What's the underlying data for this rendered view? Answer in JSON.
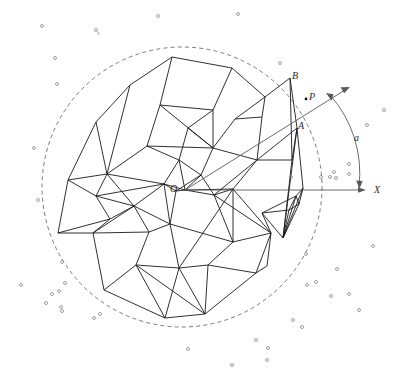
{
  "figure": {
    "background_color": "#ffffff",
    "mesh_color": "#1a1a1a",
    "circle_color": "#6b6b6b",
    "axis_color": "#5a5a5a",
    "dot_color": "#8a8a8a",
    "width": 399,
    "height": 372
  },
  "labels": [
    {
      "name": "origin-label",
      "text": "O",
      "x": 170,
      "y": 184
    },
    {
      "name": "point-b-label",
      "text": "B",
      "x": 292,
      "y": 71
    },
    {
      "name": "point-p-label",
      "text": "P",
      "x": 309,
      "y": 92
    },
    {
      "name": "point-a-label",
      "text": "A",
      "x": 298,
      "y": 121
    },
    {
      "name": "angle-label",
      "text": "a",
      "x": 354,
      "y": 133
    },
    {
      "name": "xaxis-label",
      "text": "X",
      "x": 374,
      "y": 185
    },
    {
      "name": "stray-label",
      "text": "s",
      "x": 97,
      "y": 30
    }
  ],
  "geometry": {
    "circle": {
      "cx": 182,
      "cy": 187,
      "r": 140,
      "dash": "4 3.2"
    },
    "origin": {
      "x": 185,
      "y": 190
    },
    "x_axis": {
      "x1": 185,
      "y1": 190,
      "x2": 366,
      "y2": 190
    },
    "ray": {
      "x1": 185,
      "y1": 190,
      "x2": 348,
      "y2": 88
    },
    "angle_arc": {
      "start_x": 330,
      "start_y": 95,
      "end_x": 359,
      "end_y": 187,
      "radius": 118
    },
    "point_A": {
      "x": 297,
      "y": 128
    },
    "point_B": {
      "x": 290,
      "y": 78
    },
    "point_P": {
      "x": 306,
      "y": 99
    }
  },
  "mesh_vertices": [
    [
      185,
      190
    ],
    [
      179,
      160
    ],
    [
      164,
      184
    ],
    [
      201,
      175
    ],
    [
      233,
      189
    ],
    [
      176,
      191
    ],
    [
      130,
      85
    ],
    [
      172,
      57
    ],
    [
      232,
      68
    ],
    [
      265,
      97
    ],
    [
      290,
      78
    ],
    [
      297,
      128
    ],
    [
      303,
      188
    ],
    [
      299,
      204
    ],
    [
      289,
      210
    ],
    [
      262,
      213
    ],
    [
      271,
      233
    ],
    [
      267,
      266
    ],
    [
      233,
      242
    ],
    [
      208,
      265
    ],
    [
      165,
      318
    ],
    [
      104,
      290
    ],
    [
      93,
      233
    ],
    [
      58,
      233
    ],
    [
      68,
      180
    ],
    [
      96,
      122
    ],
    [
      147,
      146
    ],
    [
      213,
      148
    ],
    [
      262,
      117
    ],
    [
      213,
      110
    ],
    [
      160,
      105
    ],
    [
      107,
      174
    ],
    [
      134,
      206
    ],
    [
      170,
      224
    ],
    [
      214,
      195
    ],
    [
      179,
      268
    ],
    [
      136,
      265
    ],
    [
      205,
      314
    ],
    [
      256,
      273
    ],
    [
      296,
      196
    ],
    [
      235,
      119
    ],
    [
      257,
      160
    ],
    [
      188,
      128
    ],
    [
      149,
      232
    ],
    [
      110,
      219
    ],
    [
      96,
      196
    ],
    [
      292,
      160
    ],
    [
      283,
      238
    ]
  ],
  "mesh_edges": [
    [
      6,
      7
    ],
    [
      7,
      8
    ],
    [
      8,
      9
    ],
    [
      9,
      10
    ],
    [
      10,
      11
    ],
    [
      11,
      12
    ],
    [
      12,
      13
    ],
    [
      13,
      14
    ],
    [
      14,
      15
    ],
    [
      15,
      16
    ],
    [
      16,
      17
    ],
    [
      17,
      38
    ],
    [
      38,
      37
    ],
    [
      37,
      20
    ],
    [
      20,
      21
    ],
    [
      21,
      22
    ],
    [
      22,
      23
    ],
    [
      23,
      24
    ],
    [
      24,
      25
    ],
    [
      25,
      6
    ],
    [
      6,
      31
    ],
    [
      31,
      25
    ],
    [
      31,
      26
    ],
    [
      26,
      30
    ],
    [
      30,
      7
    ],
    [
      30,
      29
    ],
    [
      29,
      8
    ],
    [
      29,
      42
    ],
    [
      42,
      27
    ],
    [
      27,
      30
    ],
    [
      27,
      29
    ],
    [
      27,
      40
    ],
    [
      40,
      9
    ],
    [
      40,
      28
    ],
    [
      28,
      9
    ],
    [
      28,
      41
    ],
    [
      41,
      46
    ],
    [
      46,
      10
    ],
    [
      41,
      28
    ],
    [
      41,
      11
    ],
    [
      46,
      11
    ],
    [
      11,
      47
    ],
    [
      47,
      12
    ],
    [
      47,
      13
    ],
    [
      47,
      14
    ],
    [
      14,
      39
    ],
    [
      39,
      12
    ],
    [
      39,
      15
    ],
    [
      15,
      47
    ],
    [
      26,
      27
    ],
    [
      26,
      1
    ],
    [
      1,
      42
    ],
    [
      42,
      1
    ],
    [
      1,
      2
    ],
    [
      2,
      31
    ],
    [
      2,
      32
    ],
    [
      32,
      31
    ],
    [
      32,
      44
    ],
    [
      44,
      23
    ],
    [
      44,
      45
    ],
    [
      45,
      31
    ],
    [
      45,
      24
    ],
    [
      45,
      32
    ],
    [
      44,
      22
    ],
    [
      22,
      32
    ],
    [
      32,
      43
    ],
    [
      43,
      22
    ],
    [
      43,
      33
    ],
    [
      33,
      32
    ],
    [
      33,
      2
    ],
    [
      2,
      5
    ],
    [
      5,
      0
    ],
    [
      0,
      1
    ],
    [
      0,
      3
    ],
    [
      3,
      1
    ],
    [
      3,
      27
    ],
    [
      3,
      34
    ],
    [
      34,
      4
    ],
    [
      4,
      0
    ],
    [
      0,
      5
    ],
    [
      5,
      3
    ],
    [
      4,
      34
    ],
    [
      34,
      41
    ],
    [
      4,
      41
    ],
    [
      4,
      16
    ],
    [
      16,
      34
    ],
    [
      4,
      35
    ],
    [
      35,
      33
    ],
    [
      33,
      43
    ],
    [
      43,
      36
    ],
    [
      36,
      21
    ],
    [
      36,
      35
    ],
    [
      35,
      19
    ],
    [
      19,
      18
    ],
    [
      18,
      34
    ],
    [
      18,
      16
    ],
    [
      18,
      4
    ],
    [
      19,
      35
    ],
    [
      19,
      37
    ],
    [
      37,
      36
    ],
    [
      36,
      20
    ],
    [
      20,
      35
    ],
    [
      35,
      37
    ],
    [
      19,
      38
    ],
    [
      38,
      16
    ],
    [
      16,
      17
    ],
    [
      17,
      16
    ],
    [
      38,
      17
    ],
    [
      41,
      27
    ],
    [
      34,
      0
    ],
    [
      27,
      41
    ],
    [
      2,
      0
    ],
    [
      33,
      5
    ],
    [
      5,
      33
    ],
    [
      33,
      18
    ],
    [
      18,
      33
    ],
    [
      3,
      0
    ],
    [
      23,
      22
    ],
    [
      45,
      2
    ],
    [
      24,
      31
    ],
    [
      25,
      31
    ],
    [
      34,
      3
    ],
    [
      46,
      47
    ],
    [
      47,
      39
    ],
    [
      39,
      13
    ],
    [
      17,
      16
    ]
  ],
  "scatter_points": [
    [
      42,
      26
    ],
    [
      96,
      30
    ],
    [
      158,
      16
    ],
    [
      238,
      14
    ],
    [
      55,
      58
    ],
    [
      57,
      84
    ],
    [
      34,
      148
    ],
    [
      38,
      200
    ],
    [
      62,
      262
    ],
    [
      21,
      285
    ],
    [
      52,
      294
    ],
    [
      59,
      291
    ],
    [
      46,
      303
    ],
    [
      61,
      307
    ],
    [
      65,
      283
    ],
    [
      62,
      311
    ],
    [
      94,
      318
    ],
    [
      100,
      314
    ],
    [
      188,
      349
    ],
    [
      232,
      365
    ],
    [
      256,
      340
    ],
    [
      267,
      360
    ],
    [
      268,
      348
    ],
    [
      306,
      254
    ],
    [
      316,
      282
    ],
    [
      331,
      296
    ],
    [
      337,
      269
    ],
    [
      349,
      294
    ],
    [
      359,
      310
    ],
    [
      293,
      320
    ],
    [
      302,
      327
    ],
    [
      307,
      285
    ],
    [
      349,
      174
    ],
    [
      334,
      172
    ],
    [
      336,
      178
    ],
    [
      330,
      177
    ],
    [
      321,
      177
    ],
    [
      349,
      164
    ],
    [
      280,
      63
    ],
    [
      367,
      125
    ],
    [
      373,
      246
    ],
    [
      384,
      110
    ],
    [
      291,
      177
    ]
  ]
}
